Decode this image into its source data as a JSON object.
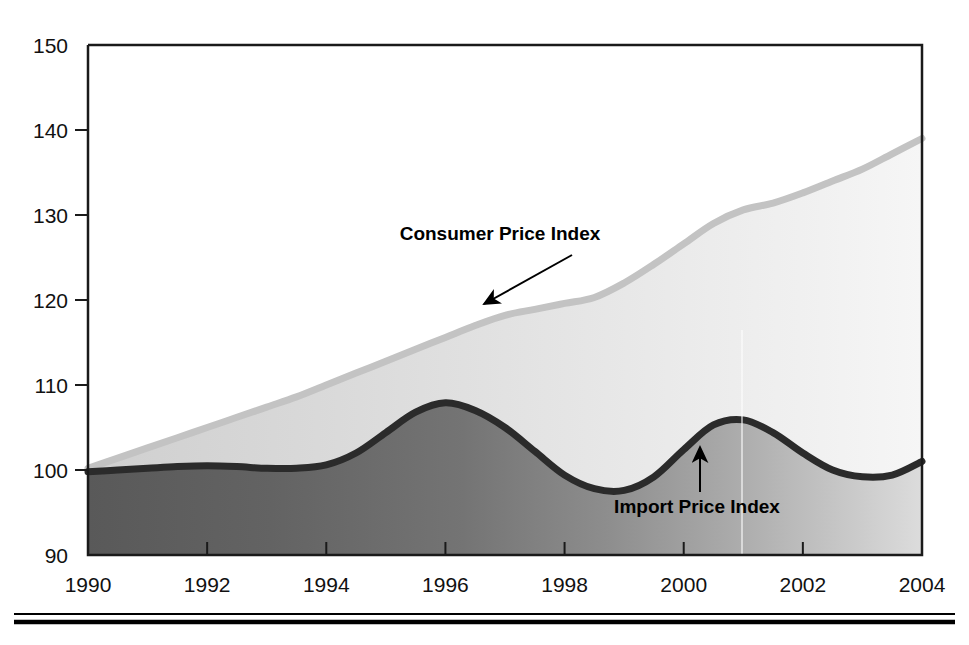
{
  "chart_data": {
    "type": "area",
    "title": "",
    "subtitle": "",
    "xlabel": "",
    "ylabel": "",
    "xlim": [
      1990,
      2004
    ],
    "ylim": [
      90,
      150
    ],
    "grid": false,
    "legend_position": "inline-annotations",
    "x_ticks": [
      "1990",
      "1992",
      "1994",
      "1996",
      "1998",
      "2000",
      "2002",
      "2004"
    ],
    "x_tick_values": [
      1990,
      1992,
      1994,
      1996,
      1998,
      2000,
      2002,
      2004
    ],
    "y_ticks": [
      "90",
      "100",
      "110",
      "120",
      "130",
      "140",
      "150"
    ],
    "y_tick_values": [
      90,
      100,
      110,
      120,
      130,
      140,
      150
    ],
    "x": [
      1990,
      1990.5,
      1991,
      1991.5,
      1992,
      1992.5,
      1993,
      1993.5,
      1994,
      1994.5,
      1995,
      1995.5,
      1996,
      1996.5,
      1997,
      1997.5,
      1998,
      1998.5,
      1999,
      1999.5,
      2000,
      2000.5,
      2001,
      2001.5,
      2002,
      2002.5,
      2003,
      2003.5,
      2004
    ],
    "series": [
      {
        "name": "Consumer Price Index",
        "color": "#c9c9c9",
        "line_color": "#c0c0c0",
        "fill": "light-gray-gradient",
        "values": [
          100.2,
          101.4,
          102.6,
          103.8,
          105.0,
          106.2,
          107.4,
          108.6,
          110.0,
          111.4,
          112.8,
          114.2,
          115.6,
          117.0,
          118.2,
          118.9,
          119.6,
          120.3,
          122.0,
          124.2,
          126.6,
          129.0,
          130.6,
          131.4,
          132.6,
          134.0,
          135.4,
          137.2,
          139.0
        ]
      },
      {
        "name": "Import Price Index",
        "color": "#6a6a6a",
        "line_color": "#2b2b2b",
        "fill": "dark-gray-gradient",
        "values": [
          99.8,
          100.0,
          100.2,
          100.4,
          100.5,
          100.4,
          100.2,
          100.2,
          100.6,
          102.0,
          104.4,
          106.8,
          107.9,
          107.0,
          105.0,
          102.2,
          99.4,
          97.8,
          97.6,
          99.2,
          102.4,
          105.3,
          105.9,
          104.4,
          102.0,
          100.0,
          99.2,
          99.4,
          101.0
        ]
      }
    ],
    "annotations": [
      {
        "text": "Consumer Price Index",
        "series": "Consumer Price Index",
        "text_x": 500,
        "text_y": 240,
        "arrow_from_x": 572,
        "arrow_from_y": 255,
        "arrow_to_x": 484,
        "arrow_to_y": 304,
        "arrow_style": "diagonal-down-left"
      },
      {
        "text": "Import Price Index",
        "series": "Import Price Index",
        "text_x": 697,
        "text_y": 513,
        "arrow_from_x": 700,
        "arrow_from_y": 492,
        "arrow_to_x": 700,
        "arrow_to_y": 447,
        "arrow_style": "vertical-up"
      }
    ]
  },
  "colors": {
    "axis": "#1a1a1a",
    "plot_background": "#ffffff",
    "cpi_band_light": "#f4f4f4",
    "cpi_band_dark": "#d2d2d2",
    "ipi_band_light": "#d8d8d8",
    "ipi_band_dark": "#5a5a5a",
    "cpi_line": "#c3c3c3",
    "ipi_line": "#2b2b2b",
    "text": "#111111",
    "rule": "#000000"
  },
  "footer_rule": {
    "name": "double-horizontal-rule",
    "visible": true
  }
}
